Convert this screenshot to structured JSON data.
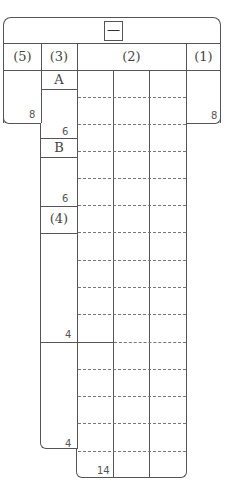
{
  "title": {
    "text": "一"
  },
  "columns": [
    {
      "id": "col5",
      "label": "(5)"
    },
    {
      "id": "col3",
      "label": "(3)"
    },
    {
      "id": "col2",
      "label": "(2)"
    },
    {
      "id": "col1",
      "label": "(1)"
    }
  ],
  "sections": {
    "a": {
      "label": "A",
      "count": "6"
    },
    "b": {
      "label": "B",
      "count": "6"
    },
    "four": {
      "label": "(4)",
      "count_upper": "4",
      "count_lower": "4"
    }
  },
  "counts": {
    "col5": "8",
    "col1": "8",
    "col2": "14"
  },
  "colors": {
    "line": "#555555",
    "dash": "#777777",
    "background": "#ffffff"
  }
}
